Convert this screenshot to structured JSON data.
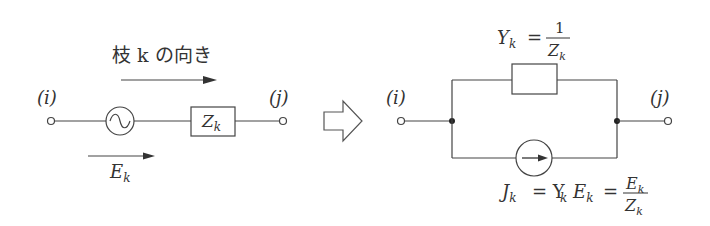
{
  "left_circuit": {
    "branch_label": "枝 k の向き",
    "node_i": "(i)",
    "node_j": "(j)",
    "impedance": "Z",
    "impedance_sub": "k",
    "emf": "E",
    "emf_sub": "k"
  },
  "right_circuit": {
    "node_i": "(i)",
    "node_j": "(j)",
    "admittance_lhs": "Y",
    "admittance_sub": "k",
    "admittance_eq": "=",
    "admittance_num": "1",
    "admittance_den": "Z",
    "admittance_den_sub": "k",
    "current_lhs": "J",
    "current_sub": "k",
    "current_eq1": "= Y",
    "current_eq1_sub": "k",
    "current_e": "E",
    "current_e_sub": "k",
    "current_eq2": "=",
    "current_num": "E",
    "current_num_sub": "k",
    "current_den": "Z",
    "current_den_sub": "k"
  },
  "colors": {
    "line": "#444444",
    "text": "#333333"
  }
}
